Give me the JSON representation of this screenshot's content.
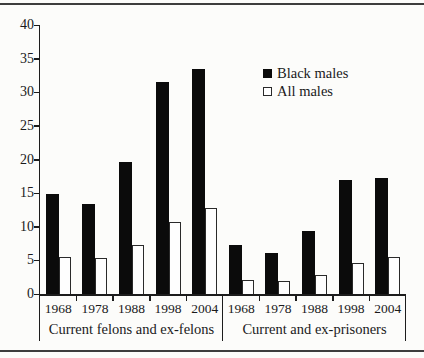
{
  "figure": {
    "background_color": "#fcfcfa",
    "rule_color": "#3d3d3d",
    "title": ""
  },
  "legend": {
    "position": "upper-right-inside",
    "items": [
      {
        "label": "Black males",
        "swatch": "filled-black-square",
        "color": "#0b0b0b"
      },
      {
        "label": "All males",
        "swatch": "open-white-square",
        "color": "#ffffff"
      }
    ]
  },
  "chart_data": {
    "type": "bar",
    "title": "",
    "xlabel": "",
    "ylabel": "",
    "ylim": [
      0,
      40
    ],
    "yticks": [
      0,
      5,
      10,
      15,
      20,
      25,
      30,
      35,
      40
    ],
    "grid": false,
    "legend_position": "upper-right-inside",
    "bar_colors": {
      "Black males": "#0b0b0b",
      "All males": "#ffffff"
    },
    "groups": [
      {
        "label": "Current felons and ex-felons",
        "categories": [
          "1968",
          "1978",
          "1988",
          "1998",
          "2004"
        ],
        "series": [
          {
            "name": "Black males",
            "values": [
              14.8,
              13.4,
              19.7,
              31.5,
              33.4
            ]
          },
          {
            "name": "All males",
            "values": [
              5.5,
              5.3,
              7.3,
              10.7,
              12.8
            ]
          }
        ]
      },
      {
        "label": "Current and ex-prisoners",
        "categories": [
          "1968",
          "1978",
          "1988",
          "1998",
          "2004"
        ],
        "series": [
          {
            "name": "Black males",
            "values": [
              7.3,
              6.1,
              9.4,
              16.9,
              17.2
            ]
          },
          {
            "name": "All males",
            "values": [
              2.1,
              1.9,
              2.8,
              4.6,
              5.5
            ]
          }
        ]
      }
    ]
  }
}
